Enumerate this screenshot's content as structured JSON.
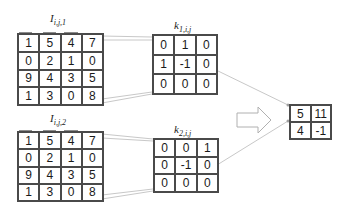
{
  "input1": {
    "label_base": "I",
    "label_sub": "i,j,1",
    "rows": [
      [
        "1",
        "5",
        "4",
        "7"
      ],
      [
        "0",
        "2",
        "1",
        "0"
      ],
      [
        "9",
        "4",
        "3",
        "5"
      ],
      [
        "1",
        "3",
        "0",
        "8"
      ]
    ]
  },
  "input2": {
    "label_base": "I",
    "label_sub": "i,j,2",
    "rows": [
      [
        "1",
        "5",
        "4",
        "7"
      ],
      [
        "0",
        "2",
        "1",
        "0"
      ],
      [
        "9",
        "4",
        "3",
        "5"
      ],
      [
        "1",
        "3",
        "0",
        "8"
      ]
    ]
  },
  "kernel1": {
    "label_base": "k",
    "label_sub": "1,i,j",
    "rows": [
      [
        "0",
        "1",
        "0"
      ],
      [
        "1",
        "-1",
        "0"
      ],
      [
        "0",
        "0",
        "0"
      ]
    ]
  },
  "kernel2": {
    "label_base": "k",
    "label_sub": "2,i,j",
    "rows": [
      [
        "0",
        "0",
        "1"
      ],
      [
        "0",
        "-1",
        "0"
      ],
      [
        "0",
        "0",
        "0"
      ]
    ]
  },
  "output": {
    "rows": [
      [
        "5",
        "11"
      ],
      [
        "4",
        "-1"
      ]
    ]
  },
  "colors": {
    "grid_line": "#4a4a4a",
    "highlight": "#8c8c8c",
    "connector": "#c8c8c8",
    "arrow_outline": "#b0b0b0"
  }
}
